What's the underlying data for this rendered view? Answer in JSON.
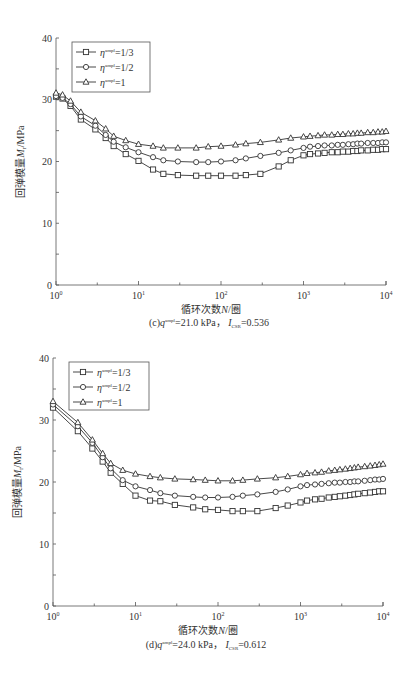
{
  "figure": {
    "panels": [
      "c",
      "d"
    ]
  },
  "chart_data": [
    {
      "type": "line",
      "panel": "c",
      "caption": "(c) q^ampl=21.0 kPa，I_CSR=0.536",
      "caption_parts": {
        "prefix": "(c)",
        "q_label": "q",
        "q_sup": "ampl",
        "q_value": "=21.0 kPa，",
        "i_label": "I",
        "i_sub": "CSR",
        "i_value": "=0.536"
      },
      "xlabel": "循环次数N/圈",
      "xlabel_parts": {
        "pre": "循环次数",
        "var": "N",
        "post": "/圈"
      },
      "ylabel": "回弹模量M_r/MPa",
      "ylabel_parts": {
        "pre": "回弹模量",
        "var": "M",
        "sub": "r",
        "post": "/MPa"
      },
      "xscale": "log",
      "xlim": [
        1,
        10000
      ],
      "ylim": [
        0,
        40
      ],
      "xticks": [
        "10^0",
        "10^1",
        "10^2",
        "10^3",
        "10^4"
      ],
      "xtick_labels": [
        {
          "base": "10",
          "exp": "0"
        },
        {
          "base": "10",
          "exp": "1"
        },
        {
          "base": "10",
          "exp": "2"
        },
        {
          "base": "10",
          "exp": "3"
        },
        {
          "base": "10",
          "exp": "4"
        }
      ],
      "yticks": [
        0,
        10,
        20,
        30,
        40
      ],
      "legend_position": "upper left",
      "grid": false,
      "series": [
        {
          "name": "η^ampl=1/3",
          "legend_prefix": "η",
          "legend_sup": "ampl",
          "legend_value": "=1/3",
          "marker": "square",
          "x": [
            1,
            1.2,
            1.5,
            2,
            3,
            4,
            5,
            7,
            10,
            15,
            20,
            30,
            50,
            70,
            100,
            150,
            200,
            300,
            500,
            700,
            1000,
            1200,
            1500,
            1800,
            2200,
            2600,
            3000,
            3500,
            4000,
            4500,
            5000,
            6000,
            7000,
            8000,
            9000,
            10000
          ],
          "values": [
            30.5,
            30.2,
            29.0,
            26.8,
            25.2,
            23.8,
            22.5,
            21.2,
            20.1,
            18.7,
            18.0,
            17.8,
            17.7,
            17.7,
            17.7,
            17.7,
            17.8,
            18.0,
            19.2,
            20.2,
            21.0,
            21.2,
            21.3,
            21.4,
            21.5,
            21.5,
            21.6,
            21.6,
            21.7,
            21.7,
            21.8,
            21.8,
            21.9,
            21.9,
            22.0,
            22.0
          ]
        },
        {
          "name": "η^ampl=1/2",
          "legend_prefix": "η",
          "legend_sup": "ampl",
          "legend_value": "=1/2",
          "marker": "circle",
          "x": [
            1,
            1.2,
            1.5,
            2,
            3,
            4,
            5,
            7,
            10,
            15,
            20,
            30,
            50,
            70,
            100,
            150,
            200,
            300,
            500,
            700,
            1000,
            1200,
            1500,
            1800,
            2200,
            2600,
            3000,
            3500,
            4000,
            4500,
            5000,
            6000,
            7000,
            8000,
            9000,
            10000
          ],
          "values": [
            30.6,
            30.3,
            29.3,
            27.3,
            25.8,
            24.3,
            23.2,
            22.3,
            21.5,
            20.7,
            20.2,
            20.0,
            19.9,
            19.9,
            20.0,
            20.2,
            20.5,
            20.9,
            21.4,
            21.8,
            22.2,
            22.4,
            22.5,
            22.6,
            22.6,
            22.7,
            22.7,
            22.8,
            22.8,
            22.9,
            22.9,
            23.0,
            23.0,
            23.0,
            23.1,
            23.1
          ]
        },
        {
          "name": "η^ampl=1",
          "legend_prefix": "η",
          "legend_sup": "ampl",
          "legend_value": "=1",
          "marker": "triangle",
          "x": [
            1,
            1.2,
            1.5,
            2,
            3,
            4,
            5,
            7,
            10,
            15,
            20,
            30,
            50,
            70,
            100,
            150,
            200,
            300,
            500,
            700,
            1000,
            1200,
            1500,
            1800,
            2200,
            2600,
            3000,
            3500,
            4000,
            4500,
            5000,
            6000,
            7000,
            8000,
            9000,
            10000
          ],
          "values": [
            31.1,
            30.8,
            29.8,
            28.0,
            26.6,
            25.3,
            24.1,
            23.4,
            22.8,
            22.5,
            22.2,
            22.2,
            22.2,
            22.4,
            22.5,
            22.7,
            22.9,
            23.1,
            23.5,
            23.8,
            24.0,
            24.1,
            24.2,
            24.3,
            24.3,
            24.4,
            24.4,
            24.5,
            24.5,
            24.6,
            24.6,
            24.7,
            24.7,
            24.8,
            24.8,
            24.9
          ]
        }
      ]
    },
    {
      "type": "line",
      "panel": "d",
      "caption": "(d) q^ampl=24.0 kPa，I_CSR=0.612",
      "caption_parts": {
        "prefix": "(d)",
        "q_label": "q",
        "q_sup": "ampl",
        "q_value": "=24.0 kPa，",
        "i_label": "I",
        "i_sub": "CSR",
        "i_value": "=0.612"
      },
      "xlabel": "循环次数N/圈",
      "xlabel_parts": {
        "pre": "循环次数",
        "var": "N",
        "post": "/圈"
      },
      "ylabel": "回弹模量M_r/MPa",
      "ylabel_parts": {
        "pre": "回弹模量",
        "var": "M",
        "sub": "r",
        "post": "/MPa"
      },
      "xscale": "log",
      "xlim": [
        1,
        10000
      ],
      "ylim": [
        0,
        40
      ],
      "xticks": [
        "10^0",
        "10^1",
        "10^2",
        "10^3",
        "10^4"
      ],
      "xtick_labels": [
        {
          "base": "10",
          "exp": "0"
        },
        {
          "base": "10",
          "exp": "1"
        },
        {
          "base": "10",
          "exp": "2"
        },
        {
          "base": "10",
          "exp": "3"
        },
        {
          "base": "10",
          "exp": "4"
        }
      ],
      "yticks": [
        0,
        10,
        20,
        30,
        40
      ],
      "legend_position": "upper left",
      "grid": false,
      "series": [
        {
          "name": "η^ampl=1/3",
          "legend_prefix": "η",
          "legend_sup": "ampl",
          "legend_value": "=1/3",
          "marker": "square",
          "x": [
            1,
            2,
            3,
            4,
            5,
            7,
            10,
            15,
            20,
            30,
            50,
            70,
            100,
            150,
            200,
            300,
            500,
            700,
            1000,
            1200,
            1500,
            1800,
            2200,
            2600,
            3000,
            3500,
            4000,
            4500,
            5000,
            6000,
            7000,
            8000,
            9000,
            10000
          ],
          "values": [
            32.0,
            28.2,
            25.4,
            23.3,
            21.5,
            19.7,
            17.8,
            17.0,
            16.9,
            16.3,
            15.9,
            15.6,
            15.5,
            15.3,
            15.3,
            15.3,
            15.8,
            16.2,
            16.7,
            17.0,
            17.2,
            17.3,
            17.5,
            17.6,
            17.7,
            17.8,
            17.9,
            18.0,
            18.1,
            18.2,
            18.3,
            18.4,
            18.5,
            18.5
          ]
        },
        {
          "name": "η^ampl=1/2",
          "legend_prefix": "η",
          "legend_sup": "ampl",
          "legend_value": "=1/2",
          "marker": "circle",
          "x": [
            1,
            2,
            3,
            4,
            5,
            7,
            10,
            15,
            20,
            30,
            50,
            70,
            100,
            150,
            200,
            300,
            500,
            700,
            1000,
            1200,
            1500,
            1800,
            2200,
            2600,
            3000,
            3500,
            4000,
            4500,
            5000,
            6000,
            7000,
            8000,
            9000,
            10000
          ],
          "values": [
            32.5,
            29.0,
            26.3,
            24.0,
            22.2,
            20.3,
            19.3,
            18.7,
            18.2,
            17.8,
            17.6,
            17.5,
            17.5,
            17.6,
            17.8,
            18.0,
            18.4,
            18.8,
            19.3,
            19.5,
            19.6,
            19.7,
            19.8,
            19.9,
            19.9,
            20.0,
            20.0,
            20.1,
            20.1,
            20.2,
            20.3,
            20.4,
            20.4,
            20.5
          ]
        },
        {
          "name": "η^ampl=1",
          "legend_prefix": "η",
          "legend_sup": "ampl",
          "legend_value": "=1",
          "marker": "triangle",
          "x": [
            1,
            2,
            3,
            4,
            5,
            7,
            10,
            15,
            20,
            30,
            50,
            70,
            100,
            150,
            200,
            300,
            500,
            700,
            1000,
            1200,
            1500,
            1800,
            2200,
            2600,
            3000,
            3500,
            4000,
            4500,
            5000,
            6000,
            7000,
            8000,
            9000,
            10000
          ],
          "values": [
            33.0,
            29.6,
            26.8,
            24.6,
            23.0,
            21.9,
            21.3,
            20.9,
            20.7,
            20.5,
            20.4,
            20.3,
            20.2,
            20.2,
            20.3,
            20.5,
            20.7,
            20.9,
            21.2,
            21.4,
            21.5,
            21.6,
            21.8,
            21.9,
            22.0,
            22.1,
            22.2,
            22.3,
            22.4,
            22.5,
            22.6,
            22.7,
            22.8,
            22.9
          ]
        }
      ]
    }
  ]
}
